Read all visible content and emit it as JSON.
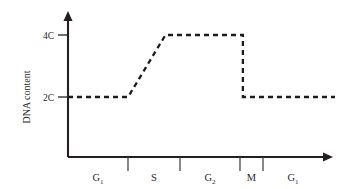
{
  "figure": {
    "background_color": "#ffffff",
    "ink_color": "#231f20",
    "width": 341,
    "height": 189
  },
  "chart_data": {
    "type": "line",
    "title": "",
    "subtitle": "",
    "xlabel": "",
    "ylabel": "DNA content",
    "grid": false,
    "legend_position": "none",
    "line_style": "dashed",
    "line_color": "#1c1c1c",
    "xlim": [
      0,
      100
    ],
    "ylim": [
      0,
      5.2
    ],
    "ytick_values": [
      2,
      4
    ],
    "ytick_labels": [
      "2C",
      "4C"
    ],
    "xtick_labels": [],
    "x_axis_arrow": true,
    "y_axis_arrow": true,
    "x": [
      0,
      22.5,
      36.5,
      65.5,
      65.5,
      100
    ],
    "y": [
      2,
      2,
      4,
      4,
      2,
      2
    ],
    "series": [
      {
        "name": "DNA content",
        "x": [
          0,
          22.5,
          36.5,
          65.5,
          65.5,
          100
        ],
        "values": [
          2,
          2,
          4,
          4,
          2,
          2
        ]
      }
    ],
    "phases": [
      {
        "label": "G",
        "subscript": "1",
        "start": 0,
        "end": 22.5,
        "center": 11.2
      },
      {
        "label": "S",
        "subscript": "",
        "start": 22.5,
        "end": 42.0,
        "center": 32.2
      },
      {
        "label": "G",
        "subscript": "2",
        "start": 42.0,
        "end": 64.4,
        "center": 53.2
      },
      {
        "label": "M",
        "subscript": "",
        "start": 64.4,
        "end": 73.0,
        "center": 68.7
      },
      {
        "label": "G",
        "subscript": "1",
        "start": 73.0,
        "end": 100,
        "center": 86.0
      }
    ],
    "phase_divider_positions": [
      22.5,
      42.0,
      64.4,
      73.0
    ],
    "annotations": [
      "DNA content stays at 2C through G1",
      "DNA content doubles from 2C to 4C during S phase",
      "DNA content remains 4C through G2",
      "DNA content halves back to 2C at M phase"
    ]
  },
  "axis": {
    "y_label": "DNA content",
    "y_ticks": [
      {
        "label": "4C",
        "value": 4
      },
      {
        "label": "2C",
        "value": 2
      }
    ]
  },
  "phase_labels": [
    {
      "id": "phase-g1-first",
      "base": "G",
      "sub": "1"
    },
    {
      "id": "phase-s",
      "base": "S",
      "sub": ""
    },
    {
      "id": "phase-g2",
      "base": "G",
      "sub": "2"
    },
    {
      "id": "phase-m",
      "base": "M",
      "sub": ""
    },
    {
      "id": "phase-g1-second",
      "base": "G",
      "sub": "1"
    }
  ]
}
